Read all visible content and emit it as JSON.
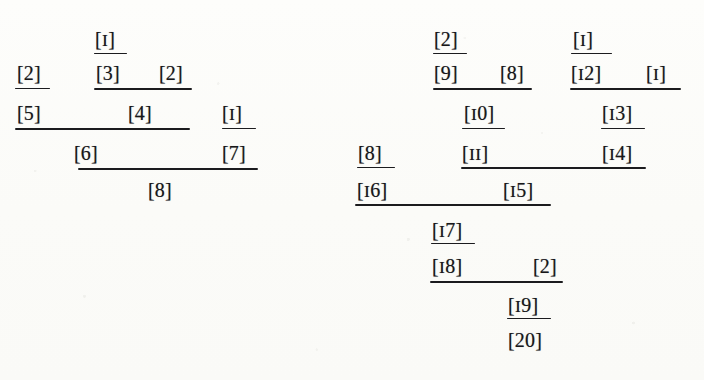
{
  "figure": {
    "kind": "proof-tree-derivation",
    "caption": "",
    "ink_color": "#17171a",
    "paper_color": "#fdfdfb",
    "trees": [
      {
        "id": "left-tree",
        "name": "left-derivation-tree",
        "conclusion": "[8]",
        "nodes": [
          {
            "id": "L1",
            "label": "[1]",
            "x": 95,
            "y": 29
          },
          {
            "id": "L2",
            "label": "[2]",
            "x": 17,
            "y": 63
          },
          {
            "id": "L3",
            "label": "[3]",
            "x": 96,
            "y": 63
          },
          {
            "id": "L4",
            "label": "[2]",
            "x": 159,
            "y": 63
          },
          {
            "id": "L5",
            "label": "[5]",
            "x": 17,
            "y": 103
          },
          {
            "id": "L6",
            "label": "[4]",
            "x": 128,
            "y": 103
          },
          {
            "id": "L7",
            "label": "[1]",
            "x": 222,
            "y": 103
          },
          {
            "id": "L8",
            "label": "[6]",
            "x": 74,
            "y": 143
          },
          {
            "id": "L9",
            "label": "[7]",
            "x": 222,
            "y": 143
          },
          {
            "id": "L10",
            "label": "[8]",
            "x": 148,
            "y": 180
          }
        ],
        "rules": [
          {
            "id": "LR1",
            "x": 94,
            "y": 53,
            "w": 33
          },
          {
            "id": "LR2",
            "x": 15,
            "y": 88,
            "w": 35
          },
          {
            "id": "LR3",
            "x": 94,
            "y": 88,
            "w": 98
          },
          {
            "id": "LR4",
            "x": 222,
            "y": 128,
            "w": 34
          },
          {
            "id": "LR5",
            "x": 15,
            "y": 128,
            "w": 175
          },
          {
            "id": "LR6",
            "x": 78,
            "y": 168,
            "w": 180
          }
        ]
      },
      {
        "id": "right-tree",
        "name": "right-derivation-tree",
        "conclusion": "[20]",
        "nodes": [
          {
            "id": "R1",
            "label": "[2]",
            "x": 434,
            "y": 29
          },
          {
            "id": "R2",
            "label": "[1]",
            "x": 573,
            "y": 29
          },
          {
            "id": "R3",
            "label": "[9]",
            "x": 434,
            "y": 63
          },
          {
            "id": "R4",
            "label": "[8]",
            "x": 500,
            "y": 63
          },
          {
            "id": "R5",
            "label": "[12]",
            "x": 571,
            "y": 63
          },
          {
            "id": "R6",
            "label": "[1]",
            "x": 646,
            "y": 63
          },
          {
            "id": "R7",
            "label": "[10]",
            "x": 464,
            "y": 103
          },
          {
            "id": "R8",
            "label": "[13]",
            "x": 602,
            "y": 103
          },
          {
            "id": "R9",
            "label": "[8]",
            "x": 358,
            "y": 143
          },
          {
            "id": "R10",
            "label": "[11]",
            "x": 462,
            "y": 143
          },
          {
            "id": "R11",
            "label": "[14]",
            "x": 602,
            "y": 143
          },
          {
            "id": "R12",
            "label": "[16]",
            "x": 357,
            "y": 180
          },
          {
            "id": "R13",
            "label": "[15]",
            "x": 503,
            "y": 180
          },
          {
            "id": "R14",
            "label": "[17]",
            "x": 432,
            "y": 220
          },
          {
            "id": "R15",
            "label": "[18]",
            "x": 432,
            "y": 256
          },
          {
            "id": "R16",
            "label": "[2]",
            "x": 533,
            "y": 256
          },
          {
            "id": "R17",
            "label": "[19]",
            "x": 508,
            "y": 295
          },
          {
            "id": "R18",
            "label": "[20]",
            "x": 508,
            "y": 330
          }
        ],
        "rules": [
          {
            "id": "RR1",
            "x": 433,
            "y": 53,
            "w": 34
          },
          {
            "id": "RR2",
            "x": 571,
            "y": 53,
            "w": 41
          },
          {
            "id": "RR3",
            "x": 433,
            "y": 88,
            "w": 99
          },
          {
            "id": "RR4",
            "x": 570,
            "y": 88,
            "w": 111
          },
          {
            "id": "RR5",
            "x": 462,
            "y": 128,
            "w": 43
          },
          {
            "id": "RR6",
            "x": 601,
            "y": 128,
            "w": 44
          },
          {
            "id": "RR7",
            "x": 357,
            "y": 167,
            "w": 38
          },
          {
            "id": "RR8",
            "x": 461,
            "y": 167,
            "w": 185
          },
          {
            "id": "RR9",
            "x": 355,
            "y": 204,
            "w": 196
          },
          {
            "id": "RR10",
            "x": 431,
            "y": 243,
            "w": 44
          },
          {
            "id": "RR11",
            "x": 430,
            "y": 281,
            "w": 133
          },
          {
            "id": "RR12",
            "x": 507,
            "y": 318,
            "w": 44
          }
        ]
      }
    ]
  }
}
